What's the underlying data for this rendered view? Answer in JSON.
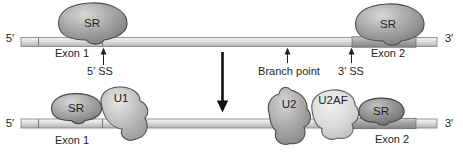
{
  "figure": {
    "colors": {
      "strand_light": "#dcdcdc",
      "exon_dark": "#9a9a9a",
      "protein_gray": "#9c9c9c",
      "u2af_light": "#e0e0e0",
      "outline": "#4a4a4a",
      "arrow_black": "#111111"
    },
    "top_strand": {
      "five_prime": "5′",
      "three_prime": "3′",
      "exon1_label": "Exon 1",
      "exon2_label": "Exon 2",
      "sr_left": "SR",
      "sr_right": "SR",
      "ss5_label": "5′ SS",
      "branch_label": "Branch point",
      "ss3_label": "3′ SS"
    },
    "bottom_strand": {
      "five_prime": "5′",
      "three_prime": "3′",
      "exon1_label": "Exon 1",
      "exon2_label": "Exon 2",
      "sr_left": "SR",
      "u1_label": "U1",
      "u2_label": "U2",
      "u2af_label": "U2AF",
      "sr_right": "SR"
    }
  }
}
